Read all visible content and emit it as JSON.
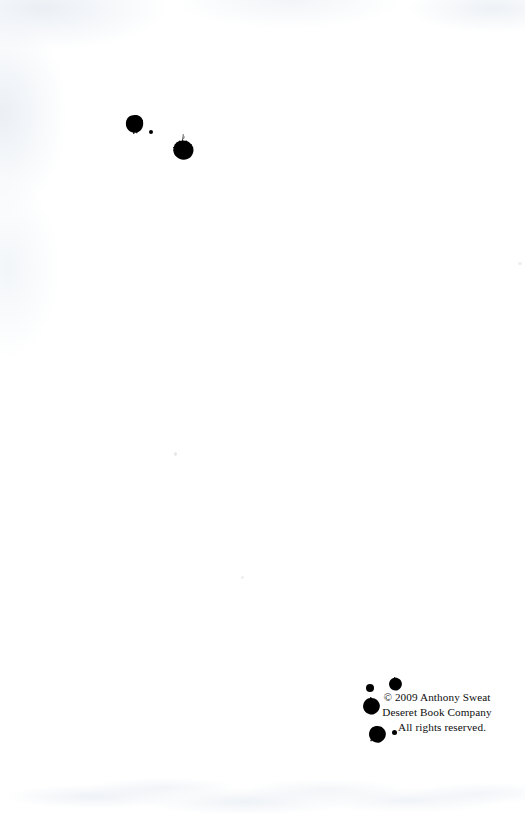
{
  "page": {
    "kind": "book-copyright-page",
    "background_color": "#ffffff",
    "ink_color": "#000000",
    "width": 525,
    "height": 814
  },
  "copyright": {
    "line1": "© 2009 Anthony Sweat",
    "line2": "Deseret Book Company",
    "line3": "All rights reserved."
  },
  "ink_blots": {
    "top_cluster": [
      {
        "name": "ink-blot-large-upper",
        "cx": 134,
        "cy": 124,
        "d": 16
      },
      {
        "name": "ink-blot-speck-upper",
        "cx": 151,
        "cy": 132,
        "d": 4
      },
      {
        "name": "ink-blot-splatter-main",
        "cx": 182,
        "cy": 157,
        "d": 29
      }
    ],
    "bottom_cluster": [
      {
        "name": "ink-blot-small-top-left",
        "cx": 370,
        "cy": 688,
        "d": 8
      },
      {
        "name": "ink-blot-medium-top-right",
        "cx": 395,
        "cy": 684,
        "d": 13
      },
      {
        "name": "ink-blot-large-left",
        "cx": 371,
        "cy": 706,
        "d": 17
      },
      {
        "name": "ink-blot-large-bottom",
        "cx": 377,
        "cy": 734,
        "d": 17
      },
      {
        "name": "ink-blot-speck-bottom",
        "cx": 395,
        "cy": 733,
        "d": 5
      }
    ]
  }
}
